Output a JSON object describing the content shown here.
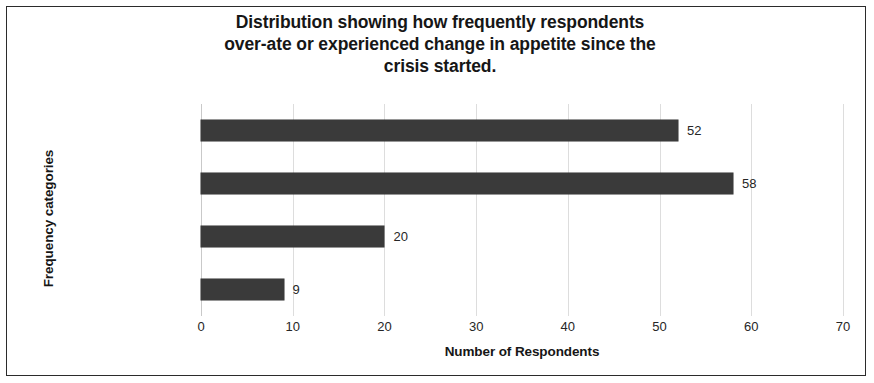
{
  "chart_data": {
    "type": "bar",
    "orientation": "horizontal",
    "title": "Distribution showing how frequently respondents over-ate or experienced change in appetite since the crisis started.",
    "title_lines": [
      "Distribution showing how frequently respondents",
      "over-ate or experienced change in appetite since the",
      "crisis started."
    ],
    "categories": [
      "Sometimes",
      "Not at all",
      "Most of the times",
      "Everyday"
    ],
    "values": [
      52,
      58,
      20,
      9
    ],
    "value_labels": [
      "52",
      "58",
      "20",
      "9"
    ],
    "xlabel": "Number of Respondents",
    "ylabel": "Frequency categories",
    "xlim": [
      0,
      70
    ],
    "xticks": [
      0,
      10,
      20,
      30,
      40,
      50,
      60,
      70
    ],
    "xtick_labels": [
      "0",
      "10",
      "20",
      "30",
      "40",
      "50",
      "60",
      "70"
    ],
    "grid": true,
    "grid_axis": "x",
    "legend": false,
    "bar_color": "#3a3a3a",
    "gridline_color": "#dddddd",
    "text_color": "#262626",
    "background_color": "#ffffff",
    "border_color": "#2b2b2b"
  }
}
